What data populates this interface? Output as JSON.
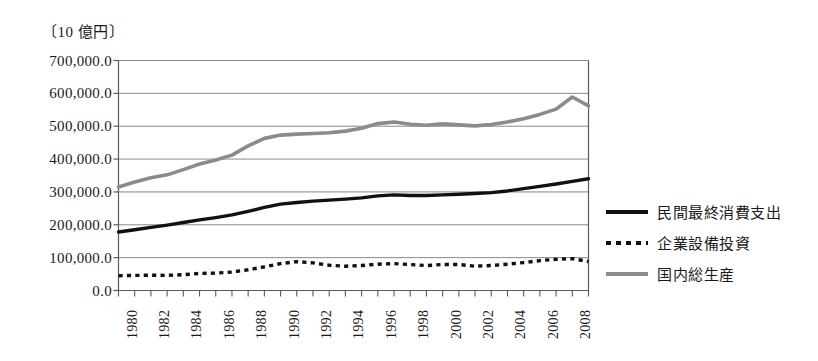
{
  "chart_data": {
    "type": "line",
    "title": "",
    "unit_label": "〔10 億円〕",
    "xlabel": "",
    "ylabel": "",
    "ylim": [
      0,
      700000
    ],
    "xlim": [
      1980,
      2009
    ],
    "grid": true,
    "legend_position": "right",
    "ytick_labels": [
      "700,000.0",
      "600,000.0",
      "500,000.0",
      "400,000.0",
      "300,000.0",
      "200,000.0",
      "100,000.0",
      "0.0"
    ],
    "ytick_values": [
      700000,
      600000,
      500000,
      400000,
      300000,
      200000,
      100000,
      0
    ],
    "xtick_labels": [
      "1980",
      "1982",
      "1984",
      "1986",
      "1988",
      "1990",
      "1992",
      "1994",
      "1996",
      "1998",
      "2000",
      "2002",
      "2004",
      "2006",
      "2008"
    ],
    "xtick_values": [
      1980,
      1982,
      1984,
      1986,
      1988,
      1990,
      1992,
      1994,
      1996,
      1998,
      2000,
      2002,
      2004,
      2006,
      2008
    ],
    "x": [
      1980,
      1981,
      1982,
      1983,
      1984,
      1985,
      1986,
      1987,
      1988,
      1989,
      1990,
      1991,
      1992,
      1993,
      1994,
      1995,
      1996,
      1997,
      1998,
      1999,
      2000,
      2001,
      2002,
      2003,
      2004,
      2005,
      2006,
      2007,
      2008,
      2009
    ],
    "series": [
      {
        "name": "民間最終消費支出",
        "style": "solid",
        "color": "#111111",
        "width": 3.4,
        "values": [
          178000,
          185000,
          192000,
          199000,
          207000,
          215000,
          222000,
          230000,
          241000,
          253000,
          263000,
          268000,
          272000,
          275000,
          278000,
          282000,
          288000,
          291000,
          289000,
          289000,
          291000,
          293000,
          295000,
          298000,
          303000,
          310000,
          317000,
          324000,
          332000,
          340000
        ]
      },
      {
        "name": "企業設備投資",
        "style": "dotted",
        "color": "#111111",
        "width": 3.4,
        "values": [
          45000,
          46000,
          46500,
          46000,
          48000,
          52000,
          53000,
          56000,
          63000,
          72000,
          82000,
          88000,
          84000,
          77000,
          74000,
          76000,
          80000,
          82000,
          79000,
          76000,
          79000,
          79000,
          74000,
          76000,
          80000,
          85000,
          91000,
          95000,
          97000,
          88000
        ]
      },
      {
        "name": "国内総生産",
        "style": "solid",
        "color": "#8b8b8b",
        "width": 3.6,
        "values": [
          315000,
          330000,
          343000,
          352000,
          368000,
          385000,
          397000,
          412000,
          440000,
          463000,
          473000,
          476000,
          478000,
          480000,
          485000,
          494000,
          508000,
          513000,
          506000,
          503000,
          507000,
          504000,
          501000,
          505000,
          513000,
          523000,
          536000,
          552000,
          589000,
          562000
        ]
      }
    ]
  },
  "legend": {
    "items": [
      {
        "label": "民間最終消費支出"
      },
      {
        "label": "企業設備投資"
      },
      {
        "label": "国内総生産"
      }
    ]
  }
}
